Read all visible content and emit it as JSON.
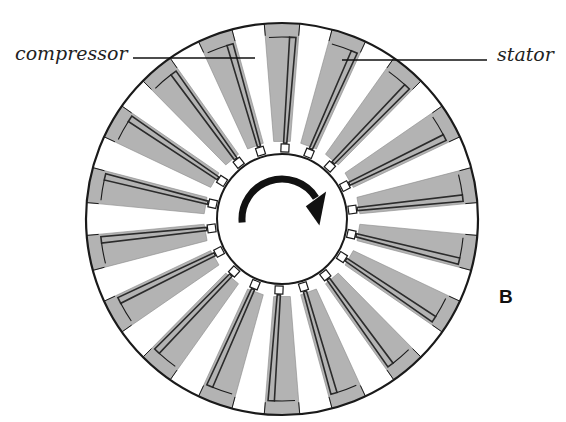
{
  "figure": {
    "panel_letter": "B",
    "labels": {
      "compressor": "compressor",
      "stator": "stator"
    },
    "rotation_direction": "clockwise",
    "geometry": {
      "center": [
        282,
        219
      ],
      "outer_radius": 196,
      "rim_inner_radius": 184,
      "hub_radius": 65,
      "tab_radius": 74,
      "stator_count": 18,
      "stator_half_width_deg_outer": 5.2,
      "stator_half_width_deg_inner": 3.0,
      "start_angle_deg": 0
    },
    "colors": {
      "background": "#ffffff",
      "stator_fill": "#b3b3b3",
      "outline": "#1a1a1a",
      "blade": "#2b2b2b",
      "arrow": "#111111"
    },
    "leaders": {
      "compressor": {
        "x1": 133,
        "y1": 58,
        "x2": 255,
        "y2": 58
      },
      "stator": {
        "x1": 342,
        "y1": 60,
        "x2": 487,
        "y2": 60
      }
    }
  }
}
